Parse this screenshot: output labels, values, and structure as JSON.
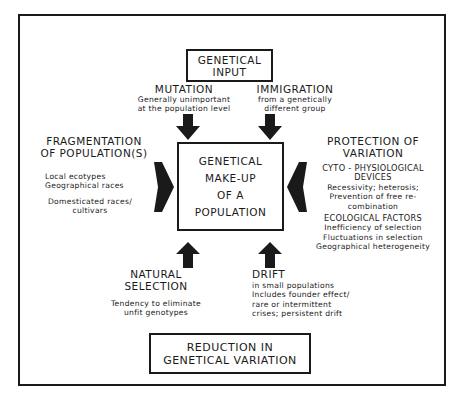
{
  "diagram": {
    "input_box": {
      "lines": [
        "GENETICAL",
        "INPUT"
      ]
    },
    "center_box": {
      "lines": [
        "GENETICAL",
        "MAKE-UP",
        "OF A",
        "POPULATION"
      ]
    },
    "output_box": {
      "lines": [
        "REDUCTION IN",
        "GENETICAL VARIATION"
      ]
    },
    "mutation": {
      "title": "MUTATION",
      "lines": [
        "Generally unimportant",
        "at the population level"
      ]
    },
    "immigration": {
      "title": "IMMIGRATION",
      "lines": [
        "from a genetically",
        "different group"
      ]
    },
    "fragmentation": {
      "title_lines": [
        "FRAGMENTATION",
        "OF POPULATION(S)"
      ],
      "group1": [
        "Local ecotypes",
        "Geographical races"
      ],
      "group2": [
        "Domesticated races/",
        "cultivars"
      ]
    },
    "protection": {
      "title_lines": [
        "PROTECTION OF",
        "VARIATION"
      ],
      "sub1_title": [
        "CYTO - PHYSIOLOGICAL",
        "DEVICES"
      ],
      "sub1_lines": [
        "Recessivity; heterosis;",
        "Prevention of free re-",
        "combination"
      ],
      "sub2_title": "ECOLOGICAL FACTORS",
      "sub2_lines": [
        "Inefficiency of selection",
        "Fluctuations in selection",
        "Geographical heterogeneity"
      ]
    },
    "natural_selection": {
      "title_lines": [
        "NATURAL",
        "SELECTION"
      ],
      "lines": [
        "Tendency to eliminate",
        "unfit genotypes"
      ]
    },
    "drift": {
      "title": "DRIFT",
      "lines": [
        "in small populations",
        "Includes founder effect/",
        "rare or intermittent",
        "crises; persistent drift"
      ]
    },
    "colors": {
      "ink": "#1a1a1a",
      "background": "#ffffff"
    }
  }
}
